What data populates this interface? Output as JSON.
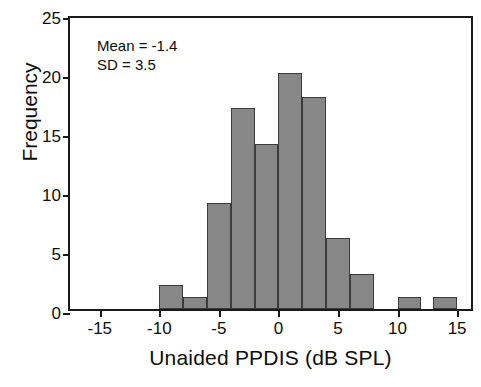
{
  "chart_data": {
    "type": "bar",
    "title": "",
    "subtitle": "",
    "xlabel": "Unaided PPDIS (dB SPL)",
    "ylabel": "Frequency",
    "xlim": [
      -17.5,
      16.5
    ],
    "ylim": [
      0,
      25
    ],
    "grid": false,
    "legend": null,
    "bin_width": 2,
    "x_ticks": [
      -15,
      -10,
      -5,
      0,
      5,
      10,
      15
    ],
    "x_tick_labels": [
      "-15",
      "-10",
      "-5",
      "0",
      "5",
      "10",
      "15"
    ],
    "y_ticks": [
      0,
      5,
      10,
      15,
      20,
      25
    ],
    "y_tick_labels": [
      "0",
      "5",
      "10",
      "15",
      "20",
      "25"
    ],
    "bins": [
      {
        "start": -10,
        "end": -8,
        "value": 2
      },
      {
        "start": -8,
        "end": -6,
        "value": 1
      },
      {
        "start": -6,
        "end": -4,
        "value": 9
      },
      {
        "start": -4,
        "end": -2,
        "value": 17
      },
      {
        "start": -2,
        "end": 0,
        "value": 14
      },
      {
        "start": 0,
        "end": 2,
        "value": 20
      },
      {
        "start": 2,
        "end": 4,
        "value": 18
      },
      {
        "start": 4,
        "end": 6,
        "value": 6
      },
      {
        "start": 6,
        "end": 8,
        "value": 3
      },
      {
        "start": 10,
        "end": 12,
        "value": 1
      },
      {
        "start": 13,
        "end": 15,
        "value": 1
      }
    ],
    "categories": [
      "-10 to -8",
      "-8 to -6",
      "-6 to -4",
      "-4 to -2",
      "-2 to 0",
      "0 to 2",
      "2 to 4",
      "4 to 6",
      "6 to 8",
      "10 to 12",
      "13 to 15"
    ],
    "values": [
      2,
      1,
      9,
      17,
      14,
      20,
      18,
      6,
      3,
      1,
      1
    ],
    "annotations": {
      "mean_text": "Mean = -1.4",
      "sd_text": "SD = 3.5",
      "mean_value": -1.4,
      "sd_value": 3.5
    },
    "colors": {
      "bar_fill": "#878787",
      "bar_edge": "#3b3b3b",
      "axis": "#1a1a1a",
      "text": "#0d0d0d",
      "background": "#ffffff"
    }
  }
}
